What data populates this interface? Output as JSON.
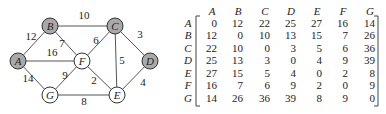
{
  "graph": {
    "nodes": [
      {
        "id": "A",
        "label": "A",
        "shaded": true
      },
      {
        "id": "B",
        "label": "B",
        "shaded": true
      },
      {
        "id": "C",
        "label": "C",
        "shaded": true
      },
      {
        "id": "D",
        "label": "D",
        "shaded": true
      },
      {
        "id": "E",
        "label": "E",
        "shaded": false
      },
      {
        "id": "F",
        "label": "F",
        "shaded": false
      },
      {
        "id": "G",
        "label": "G",
        "shaded": false
      }
    ],
    "edges": [
      {
        "from": "A",
        "to": "B",
        "weight": "12"
      },
      {
        "from": "B",
        "to": "C",
        "weight": "10"
      },
      {
        "from": "B",
        "to": "F",
        "weight": "7"
      },
      {
        "from": "A",
        "to": "F",
        "weight": "16"
      },
      {
        "from": "A",
        "to": "G",
        "weight": "14"
      },
      {
        "from": "C",
        "to": "F",
        "weight": "6"
      },
      {
        "from": "C",
        "to": "D",
        "weight": "3"
      },
      {
        "from": "C",
        "to": "E",
        "weight": "5"
      },
      {
        "from": "F",
        "to": "G",
        "weight": "9"
      },
      {
        "from": "F",
        "to": "E",
        "weight": "2"
      },
      {
        "from": "G",
        "to": "E",
        "weight": "8"
      },
      {
        "from": "D",
        "to": "E",
        "weight": "4"
      }
    ]
  },
  "matrix": {
    "col_headers": [
      "A",
      "B",
      "C",
      "D",
      "E",
      "F",
      "G"
    ],
    "row_headers": [
      "A",
      "B",
      "C",
      "D",
      "E",
      "F",
      "G"
    ],
    "rows": [
      [
        "0",
        "12",
        "22",
        "25",
        "27",
        "16",
        "14"
      ],
      [
        "12",
        "0",
        "10",
        "13",
        "15",
        "7",
        "26"
      ],
      [
        "22",
        "10",
        "0",
        "3",
        "5",
        "6",
        "36"
      ],
      [
        "25",
        "13",
        "3",
        "0",
        "4",
        "9",
        "39"
      ],
      [
        "27",
        "15",
        "5",
        "4",
        "0",
        "2",
        "8"
      ],
      [
        "16",
        "7",
        "6",
        "9",
        "2",
        "0",
        "9"
      ],
      [
        "14",
        "26",
        "36",
        "39",
        "8",
        "9",
        "0"
      ]
    ]
  }
}
